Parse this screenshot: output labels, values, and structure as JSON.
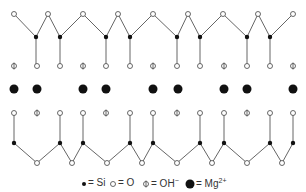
{
  "colors": {
    "bond": "#555555",
    "si_fill": "#111111",
    "o_stroke": "#444444",
    "o_fill": "#ffffff",
    "mg_fill": "#111111",
    "text": "#333333"
  },
  "legend": {
    "si": {
      "symbol": "small-filled-dot",
      "label": "= Si"
    },
    "o": {
      "symbol": "open-circle",
      "label": "= O"
    },
    "oh": {
      "symbol": "barred-circle",
      "label": "= OH",
      "sup": "−"
    },
    "mg": {
      "symbol": "large-filled-dot",
      "label": "= Mg",
      "sup": "2+"
    }
  },
  "top_layer": {
    "basal_o": [
      [
        14,
        14
      ],
      [
        48,
        14
      ],
      [
        83,
        14
      ],
      [
        118,
        14
      ],
      [
        153,
        14
      ],
      [
        188,
        14
      ],
      [
        223,
        14
      ],
      [
        258,
        14
      ],
      [
        293,
        14
      ]
    ],
    "si": [
      [
        36,
        37
      ],
      [
        60,
        37
      ],
      [
        106,
        37
      ],
      [
        130,
        37
      ],
      [
        177,
        37
      ],
      [
        200,
        37
      ],
      [
        247,
        37
      ],
      [
        270,
        37
      ]
    ],
    "apical_row_y": 66,
    "apical": [
      {
        "x": 14,
        "t": "OH"
      },
      {
        "x": 37,
        "t": "O"
      },
      {
        "x": 60,
        "t": "O"
      },
      {
        "x": 83,
        "t": "OH"
      },
      {
        "x": 106,
        "t": "O"
      },
      {
        "x": 130,
        "t": "O"
      },
      {
        "x": 153,
        "t": "OH"
      },
      {
        "x": 177,
        "t": "O"
      },
      {
        "x": 200,
        "t": "O"
      },
      {
        "x": 224,
        "t": "OH"
      },
      {
        "x": 247,
        "t": "O"
      },
      {
        "x": 270,
        "t": "O"
      },
      {
        "x": 293,
        "t": "OH"
      }
    ]
  },
  "mg_layer": {
    "y": 89,
    "x": [
      14,
      37,
      83,
      106,
      153,
      178,
      224,
      247,
      293
    ]
  },
  "bottom_layer": {
    "apical_row_y": 113,
    "apical": [
      {
        "x": 14,
        "t": "O"
      },
      {
        "x": 37,
        "t": "OH"
      },
      {
        "x": 60,
        "t": "O"
      },
      {
        "x": 83,
        "t": "O"
      },
      {
        "x": 106,
        "t": "OH"
      },
      {
        "x": 130,
        "t": "O"
      },
      {
        "x": 153,
        "t": "O"
      },
      {
        "x": 177,
        "t": "OH"
      },
      {
        "x": 200,
        "t": "O"
      },
      {
        "x": 224,
        "t": "O"
      },
      {
        "x": 247,
        "t": "OH"
      },
      {
        "x": 270,
        "t": "O"
      },
      {
        "x": 293,
        "t": "O"
      }
    ],
    "si": [
      [
        14,
        143
      ],
      [
        60,
        143
      ],
      [
        83,
        143
      ],
      [
        130,
        143
      ],
      [
        153,
        143
      ],
      [
        200,
        143
      ],
      [
        224,
        143
      ],
      [
        270,
        143
      ],
      [
        293,
        143
      ]
    ],
    "basal_o": [
      [
        37,
        163
      ],
      [
        72,
        163
      ],
      [
        107,
        163
      ],
      [
        142,
        163
      ],
      [
        177,
        163
      ],
      [
        212,
        163
      ],
      [
        247,
        163
      ],
      [
        282,
        163
      ]
    ]
  }
}
